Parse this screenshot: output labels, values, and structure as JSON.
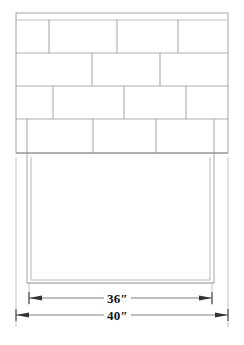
{
  "drawing": {
    "type": "technical-elevation-drawing",
    "subject": "brick veneer firebox opening elevation",
    "background_color": "#ffffff",
    "line_color": "#9a9a9a",
    "heavy_line_color": "#6f6f6f",
    "text_color": "#111111",
    "canvas": {
      "width": 244,
      "height": 345
    }
  },
  "brick_panel": {
    "label": "brick-coursing-panel",
    "bounds": {
      "x": 16,
      "y": 13,
      "width": 212,
      "height": 140
    },
    "top_strip": {
      "y": 20,
      "description": "thin top course line"
    },
    "course_lines_y": [
      13,
      20,
      53,
      86,
      119,
      153
    ],
    "courses": [
      {
        "index": 1,
        "y_top": 20,
        "y_bottom": 53,
        "joints_x": [
          49,
          117,
          178
        ]
      },
      {
        "index": 2,
        "y_top": 53,
        "y_bottom": 86,
        "joints_x": [
          92,
          160
        ]
      },
      {
        "index": 3,
        "y_top": 86,
        "y_bottom": 119,
        "joints_x": [
          53,
          124,
          186
        ]
      },
      {
        "index": 4,
        "y_top": 119,
        "y_bottom": 153,
        "joints_x": [
          93,
          156
        ],
        "inset_left_x": 27,
        "inset_right_x": 214
      }
    ]
  },
  "opening": {
    "label": "firebox-opening",
    "outer_box": {
      "x": 27,
      "y": 153,
      "width": 187,
      "height": 130
    },
    "inner_box": {
      "x": 31,
      "y": 157,
      "width": 179,
      "height": 126
    }
  },
  "extension_lines": {
    "left_x": 16,
    "right_x": 228,
    "y_top": 157,
    "y_bottom": 327
  },
  "dimensions": [
    {
      "name": "inner-width",
      "label": "36″",
      "value": 36,
      "unit": "inches",
      "y": 298,
      "x_start": 29,
      "x_end": 212,
      "arrow_direction": "outward"
    },
    {
      "name": "outer-width",
      "label": "40″",
      "value": 40,
      "unit": "inches",
      "y": 315,
      "x_start": 16,
      "x_end": 228,
      "arrow_direction": "outward"
    }
  ]
}
